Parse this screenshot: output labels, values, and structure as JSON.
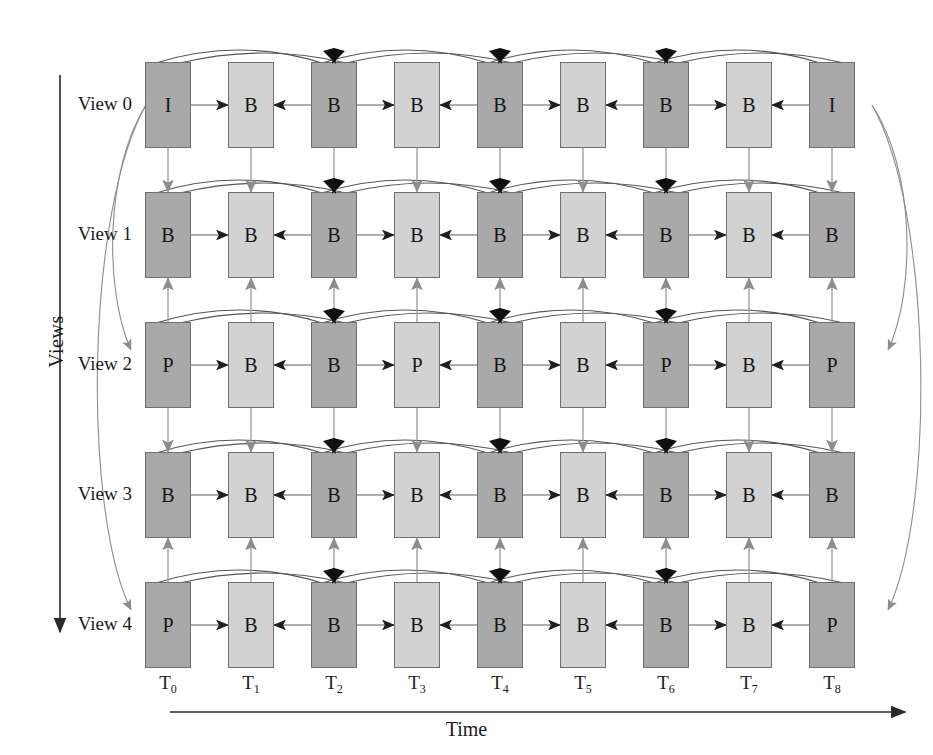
{
  "diagram": {
    "axis": {
      "y_label": "Views",
      "x_label": "Time"
    },
    "view_labels": [
      "View 0",
      "View 1",
      "View 2",
      "View 3",
      "View 4"
    ],
    "time_labels_base": [
      "T",
      "T",
      "T",
      "T",
      "T",
      "T",
      "T",
      "T",
      "T"
    ],
    "time_labels_sub": [
      "0",
      "1",
      "2",
      "3",
      "4",
      "5",
      "6",
      "7",
      "8"
    ],
    "colors": {
      "dark_frame": "#a9a9a9",
      "light_frame": "#d2d2d2",
      "frame_border": "#6f6f6f",
      "arrow_gray": "#8a8a8a",
      "arrow_dark": "#3a3a3a",
      "background": "#ffffff",
      "text": "#1a1a1a"
    },
    "frames": [
      {
        "view": 0,
        "cells": [
          {
            "t": 0,
            "type": "I",
            "shade": "dark"
          },
          {
            "t": 1,
            "type": "B",
            "shade": "light"
          },
          {
            "t": 2,
            "type": "B",
            "shade": "dark"
          },
          {
            "t": 3,
            "type": "B",
            "shade": "light"
          },
          {
            "t": 4,
            "type": "B",
            "shade": "dark"
          },
          {
            "t": 5,
            "type": "B",
            "shade": "light"
          },
          {
            "t": 6,
            "type": "B",
            "shade": "dark"
          },
          {
            "t": 7,
            "type": "B",
            "shade": "light"
          },
          {
            "t": 8,
            "type": "I",
            "shade": "dark"
          }
        ]
      },
      {
        "view": 1,
        "cells": [
          {
            "t": 0,
            "type": "B",
            "shade": "dark"
          },
          {
            "t": 1,
            "type": "B",
            "shade": "light"
          },
          {
            "t": 2,
            "type": "B",
            "shade": "dark"
          },
          {
            "t": 3,
            "type": "B",
            "shade": "light"
          },
          {
            "t": 4,
            "type": "B",
            "shade": "dark"
          },
          {
            "t": 5,
            "type": "B",
            "shade": "light"
          },
          {
            "t": 6,
            "type": "B",
            "shade": "dark"
          },
          {
            "t": 7,
            "type": "B",
            "shade": "light"
          },
          {
            "t": 8,
            "type": "B",
            "shade": "dark"
          }
        ]
      },
      {
        "view": 2,
        "cells": [
          {
            "t": 0,
            "type": "P",
            "shade": "dark"
          },
          {
            "t": 1,
            "type": "B",
            "shade": "light"
          },
          {
            "t": 2,
            "type": "B",
            "shade": "dark"
          },
          {
            "t": 3,
            "type": "P",
            "shade": "light"
          },
          {
            "t": 4,
            "type": "B",
            "shade": "dark"
          },
          {
            "t": 5,
            "type": "B",
            "shade": "light"
          },
          {
            "t": 6,
            "type": "P",
            "shade": "dark"
          },
          {
            "t": 7,
            "type": "B",
            "shade": "light"
          },
          {
            "t": 8,
            "type": "P",
            "shade": "dark"
          }
        ]
      },
      {
        "view": 3,
        "cells": [
          {
            "t": 0,
            "type": "B",
            "shade": "dark"
          },
          {
            "t": 1,
            "type": "B",
            "shade": "light"
          },
          {
            "t": 2,
            "type": "B",
            "shade": "dark"
          },
          {
            "t": 3,
            "type": "B",
            "shade": "light"
          },
          {
            "t": 4,
            "type": "B",
            "shade": "dark"
          },
          {
            "t": 5,
            "type": "B",
            "shade": "light"
          },
          {
            "t": 6,
            "type": "B",
            "shade": "dark"
          },
          {
            "t": 7,
            "type": "B",
            "shade": "light"
          },
          {
            "t": 8,
            "type": "B",
            "shade": "dark"
          }
        ]
      },
      {
        "view": 4,
        "cells": [
          {
            "t": 0,
            "type": "P",
            "shade": "dark"
          },
          {
            "t": 1,
            "type": "B",
            "shade": "light"
          },
          {
            "t": 2,
            "type": "B",
            "shade": "dark"
          },
          {
            "t": 3,
            "type": "B",
            "shade": "light"
          },
          {
            "t": 4,
            "type": "B",
            "shade": "dark"
          },
          {
            "t": 5,
            "type": "B",
            "shade": "light"
          },
          {
            "t": 6,
            "type": "B",
            "shade": "dark"
          },
          {
            "t": 7,
            "type": "B",
            "shade": "light"
          },
          {
            "t": 8,
            "type": "P",
            "shade": "dark"
          }
        ]
      },
      null
    ],
    "inter_view_arrows": [
      {
        "from_view": 0,
        "to_view": 1,
        "direction": "down"
      },
      {
        "from_view": 2,
        "to_view": 1,
        "direction": "up"
      },
      {
        "from_view": 2,
        "to_view": 3,
        "direction": "down"
      },
      {
        "from_view": 4,
        "to_view": 3,
        "direction": "up"
      }
    ],
    "temporal_arc_spans": [
      [
        0,
        2
      ],
      [
        2,
        4
      ],
      [
        4,
        6
      ],
      [
        6,
        8
      ]
    ],
    "horizontal_arrow_pattern": "alternating: even t -> odd t (right), even t -> odd t (left)",
    "outer_loop_arcs": [
      "T0 view0 to view2 and view4 (left side)",
      "T8 view0 to view2 and view4 (right side)"
    ]
  }
}
